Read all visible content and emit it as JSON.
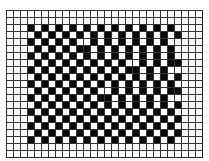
{
  "figure": {
    "columns": 28,
    "rows": 21,
    "colors": {
      "filled": "#0a0a0a",
      "empty": "#fafafa",
      "line": "#333333"
    },
    "matrix": [
      "0000000000000000000000000000",
      "0000000000000000000000000000",
      "0001010101010101010101010000",
      "0000101010101010101010101000",
      "0001010101001010101010100000",
      "0000101010110101010101010000",
      "0001010101010101010101010000",
      "0000101010101010100101011000",
      "0001010101010101011010100000",
      "0000101010101010101010101000",
      "0001010101010101010101010000",
      "0000101010101001010101011000",
      "0001010101010110101010100000",
      "0000101010101010101010101000",
      "0001010101010101010101010000",
      "0000101010101010101010101000",
      "0001010101010101010101010000",
      "0000101010101010101010101000",
      "0001010101010101010101010000",
      "0000000000000000000000000000",
      "0000000000000000000000000000"
    ]
  }
}
